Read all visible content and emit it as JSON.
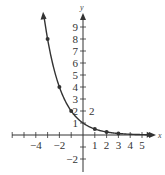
{
  "chart_data": {
    "type": "line",
    "title": "",
    "function": "y = (1/2)^x",
    "xlabel": "x",
    "ylabel": "y",
    "xlim": [
      -6,
      6
    ],
    "ylim": [
      -2.5,
      9.5
    ],
    "grid": false,
    "x_tick_labels": [
      "-4",
      "-2",
      "1",
      "2",
      "3",
      "4",
      "5"
    ],
    "y_tick_labels": [
      "1",
      "2",
      "3",
      "4",
      "5",
      "6",
      "7",
      "8",
      "9",
      "-2"
    ],
    "annotation": "2",
    "points": [
      {
        "x": -3,
        "y": 8
      },
      {
        "x": -2,
        "y": 4
      },
      {
        "x": -1,
        "y": 2
      },
      {
        "x": 1,
        "y": 0.5
      },
      {
        "x": 2,
        "y": 0.25
      },
      {
        "x": 3,
        "y": 0.125
      }
    ],
    "series": [
      {
        "name": "y = (1/2)^x",
        "x": [
          -3.3,
          -3,
          -2,
          -1,
          0,
          1,
          2,
          3,
          4,
          5
        ],
        "values": [
          9.85,
          8,
          4,
          2,
          1,
          0.5,
          0.25,
          0.125,
          0.0625,
          0.03125
        ]
      }
    ]
  },
  "colors": {
    "curve": "#333333",
    "axes": "#333333"
  }
}
